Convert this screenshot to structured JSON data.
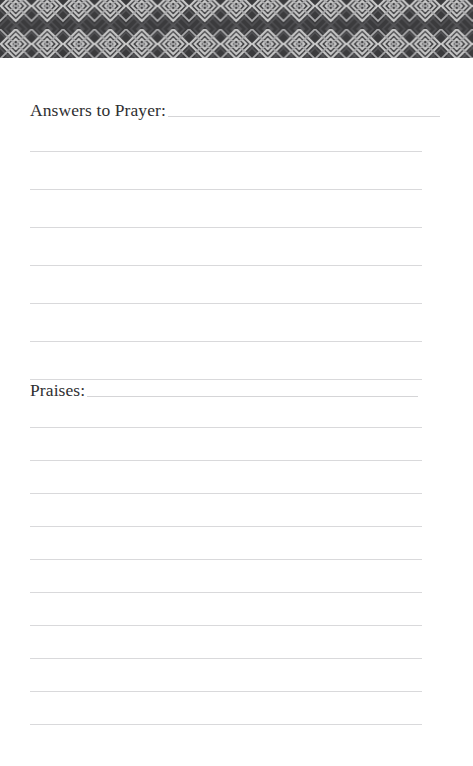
{
  "page": {
    "background_color": "#ffffff",
    "width": 473,
    "height": 766
  },
  "header": {
    "name": "decorative-diamond-band",
    "background_color": "#3b3b3d",
    "motif_color": "#c9c9c9",
    "motif": "diamond-lattice",
    "height": 58
  },
  "sections": [
    {
      "label": "Answers to Prayer:",
      "line_count": 7,
      "line_color": "#d9d9db"
    },
    {
      "label": "Praises:",
      "line_count": 10,
      "line_color": "#d9d9db"
    }
  ]
}
